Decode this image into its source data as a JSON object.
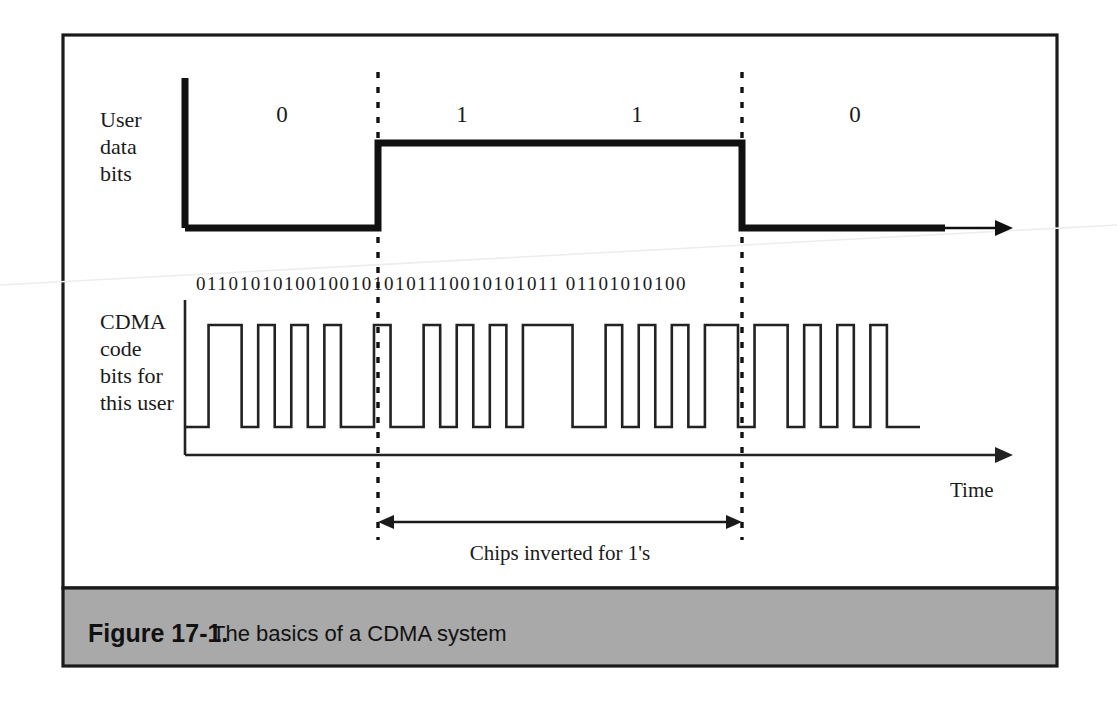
{
  "figure": {
    "caption_label": "Figure 17-1.",
    "caption_text": "The basics of a CDMA system",
    "caption_bar_color": "#a9a9a9",
    "border_color": "#1a1a1a",
    "background": "#ffffff"
  },
  "axes": {
    "time_label": "Time",
    "annotation_label": "Chips inverted for 1's"
  },
  "signals": {
    "user_data": {
      "label_lines": [
        "User",
        "data",
        "bits"
      ],
      "bit_labels": [
        "0",
        "1",
        "1",
        "0"
      ],
      "bit_label_x": [
        282,
        462,
        637,
        855
      ],
      "bits": [
        0,
        1,
        1,
        0
      ],
      "stroke": "#111111",
      "stroke_width": 7
    },
    "cdma_code": {
      "label_lines": [
        "CDMA",
        "code",
        "bits for",
        "this user"
      ],
      "chip_string_parts": [
        "01101010100",
        "1001010101110010101011 01",
        "101010100"
      ],
      "chip_string_full": "011010101001001010101110010101011 01101010100",
      "chips": [
        0,
        1,
        1,
        0,
        1,
        0,
        1,
        0,
        1,
        0,
        0,
        1,
        0,
        0,
        1,
        0,
        1,
        0,
        1,
        0,
        1,
        1,
        1,
        0,
        0,
        1,
        0,
        1,
        0,
        1,
        0,
        1,
        1,
        0,
        1,
        1,
        0,
        1,
        0,
        1,
        0,
        1,
        0,
        0
      ],
      "stroke": "#222222",
      "stroke_width": 2.6
    }
  },
  "geometry": {
    "frame": {
      "x": 63,
      "y": 35,
      "w": 994,
      "h": 553
    },
    "caption_bar": {
      "x": 63,
      "y": 588,
      "w": 994,
      "h": 78
    },
    "data_axis": {
      "x": 185,
      "y_top": 78,
      "y_base": 228,
      "y_high": 143,
      "arrow_end": 1013
    },
    "data_thick_end": 945,
    "chip_axis": {
      "x": 185,
      "y_top": 300,
      "y_base": 455,
      "y_high": 325,
      "y_low": 427,
      "arrow_end": 1013
    },
    "chip_wave_start": 192,
    "chip_wave_end": 920,
    "chip_count": 44,
    "dashed": [
      {
        "x": 378,
        "y1": 72,
        "y2": 540
      },
      {
        "x": 742,
        "y1": 72,
        "y2": 540
      }
    ],
    "annotation_arrow": {
      "x1": 378,
      "x2": 742,
      "y": 522
    },
    "chip_text_y": 290,
    "chip_text_x": 196
  },
  "labels": {
    "user_label_x": 100,
    "user_label_y": 120,
    "cdma_label_x": 100,
    "cdma_label_y": 322,
    "time_label_x": 950,
    "time_label_y": 490,
    "annotation_x": 560,
    "annotation_y": 553,
    "caption_label_x": 88,
    "caption_text_x": 212,
    "caption_y": 634
  }
}
